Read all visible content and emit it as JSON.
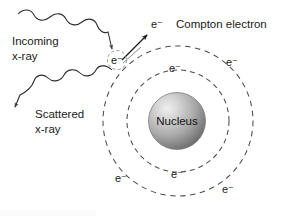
{
  "figure": {
    "background_color": "#ffffff",
    "line_color": "#4d4d4d",
    "text_color": "#1a1a1a"
  },
  "labels": {
    "incoming_line1": "Incoming",
    "incoming_line2": "x-ray",
    "scattered_line1": "Scattered",
    "scattered_line2": "x-ray",
    "compton_electron": "Compton electron",
    "nucleus": "Nucleus",
    "electron": "e⁻"
  },
  "atom": {
    "center_x": 178,
    "center_y": 121,
    "inner_orbit_radius": 51,
    "outer_orbit_radius": 75,
    "nucleus_radius": 28,
    "nucleus_fill_light": "#e4e4e4",
    "nucleus_fill_dark": "#6f6f6f",
    "orbit_dash": "5 4"
  },
  "electrons": [
    {
      "id": "interaction-electron",
      "x": 117,
      "y": 62,
      "ring": "outer",
      "circled": true
    },
    {
      "id": "compton-electron-ejected",
      "x": 156,
      "y": 27,
      "ring": "none",
      "circled": false
    },
    {
      "id": "outer-electron-upper-right",
      "x": 231,
      "y": 63,
      "ring": "outer",
      "circled": false
    },
    {
      "id": "inner-electron-top",
      "x": 174,
      "y": 69,
      "ring": "inner",
      "circled": false
    },
    {
      "id": "inner-electron-bottom",
      "x": 176,
      "y": 175,
      "ring": "inner",
      "circled": false
    },
    {
      "id": "outer-electron-lower-left",
      "x": 120,
      "y": 180,
      "ring": "outer",
      "circled": false
    },
    {
      "id": "outer-electron-lower-right",
      "x": 227,
      "y": 190,
      "ring": "outer",
      "circled": false
    }
  ],
  "rays": {
    "incoming": {
      "label": "Incoming x-ray",
      "direction": "down-right",
      "arrow_at_x": 108,
      "arrow_at_y": 51
    },
    "scattered": {
      "label": "Scattered x-ray",
      "direction": "down-left",
      "arrow_at_x": 20,
      "arrow_at_y": 110
    },
    "compton": {
      "label": "Compton electron",
      "direction": "up-right",
      "arrow_at_x": 150,
      "arrow_at_y": 35
    }
  }
}
